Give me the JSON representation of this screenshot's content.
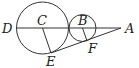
{
  "diagram": {
    "type": "geometry",
    "points": {
      "D": "D",
      "C": "C",
      "B": "B",
      "A": "A",
      "E": "E",
      "F": "F"
    },
    "segments": [
      "DA",
      "CE",
      "BF",
      "EA"
    ],
    "circles": [
      "circle-C",
      "circle-B"
    ]
  }
}
